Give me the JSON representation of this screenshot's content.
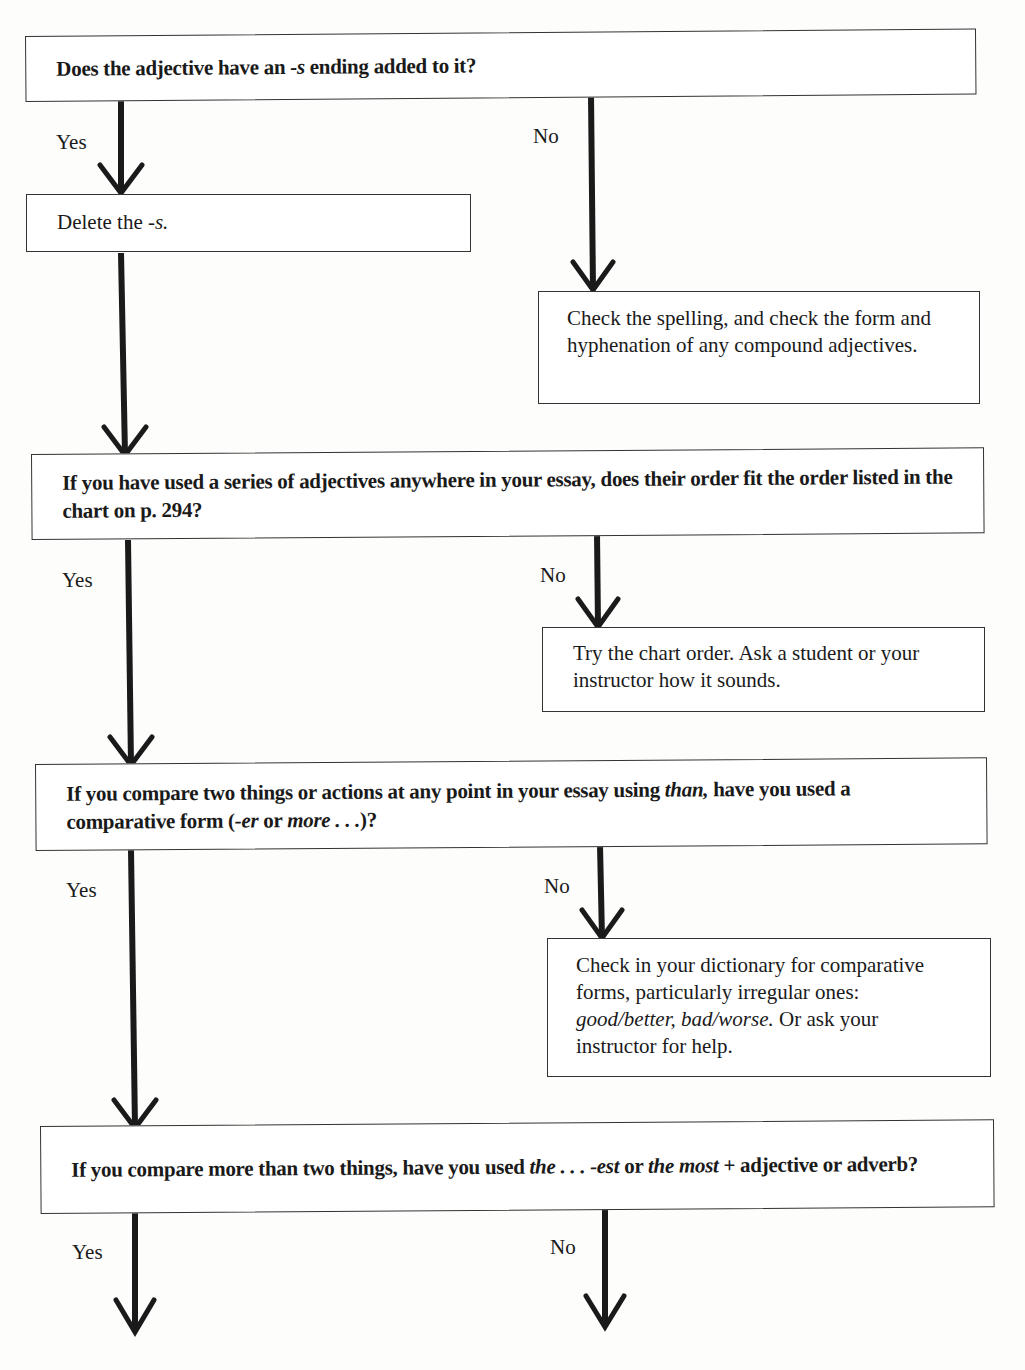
{
  "flowchart": {
    "q1": {
      "text": "Does the adjective have an -s ending added to it?",
      "parts": [
        "Does the adjective have an ",
        "-s",
        " ending added to it?"
      ],
      "yes_label": "Yes",
      "no_label": "No",
      "yes_action": {
        "parts": [
          "Delete the ",
          "-s."
        ]
      },
      "no_action": {
        "text": "Check the spelling, and check the form and hyphenation of any compound adjectives."
      }
    },
    "q2": {
      "text": "If you have used a series of adjectives anywhere in your essay, does their order fit the order listed in the chart on p. 294?",
      "yes_label": "Yes",
      "no_label": "No",
      "no_action": {
        "text": "Try the chart order. Ask a student or your instructor how it sounds."
      }
    },
    "q3": {
      "text": "If you compare two things or actions at any point in your essay using than, have you used a comparative form (-er or more . . .)?",
      "parts": [
        "If you compare two things or actions at any point in your essay using ",
        "than,",
        " have you used a comparative form (",
        "-er",
        " or ",
        "more . . .",
        ")?"
      ],
      "yes_label": "Yes",
      "no_label": "No",
      "no_action": {
        "text": "Check in your dictionary for comparative forms, particularly irregular ones: good/better, bad/worse. Or ask your instructor for help.",
        "parts": [
          "Check in your dictionary for comparative forms, particularly irregular ones: ",
          "good/better, bad/worse.",
          " Or ask your instructor for help."
        ]
      }
    },
    "q4": {
      "text": "If you compare more than two things, have you used the . . . -est or the most + adjective or adverb?",
      "parts": [
        "If you compare more than two things, have you used ",
        "the . . . -est",
        " or ",
        "the most",
        " + adjective or adverb?"
      ],
      "yes_label": "Yes",
      "no_label": "No"
    }
  }
}
